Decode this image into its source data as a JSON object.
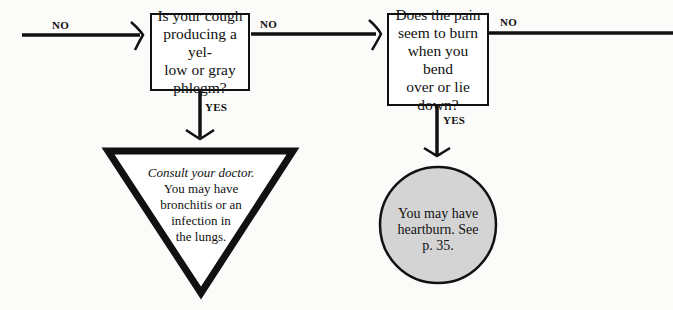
{
  "flowchart": {
    "incoming": {
      "label": "NO"
    },
    "question1": {
      "text": "Is your cough producing a yel- low or gray phlegm?",
      "lines": [
        "Is your cough",
        "producing a yel-",
        "low or gray",
        "phlegm?"
      ],
      "no_label": "NO",
      "yes_label": "YES"
    },
    "result1": {
      "shape": "triangle",
      "emphasis": "Consult your doctor.",
      "lines": [
        "You may have",
        "bronchitis or an",
        "infection in",
        "the lungs."
      ]
    },
    "question2": {
      "text": "Does the pain seem to burn when you bend over or lie down?",
      "lines": [
        "Does the pain",
        "seem to burn",
        "when you bend",
        "over or lie",
        "down?"
      ],
      "no_label": "NO",
      "yes_label": "YES"
    },
    "result2": {
      "shape": "circle",
      "lines": [
        "You may have",
        "heartburn. See",
        "p. 35."
      ],
      "fill": "#d4d4d4"
    },
    "colors": {
      "line": "#111111",
      "background": "#fbfbf9",
      "circle_fill": "#d4d4d4"
    }
  }
}
